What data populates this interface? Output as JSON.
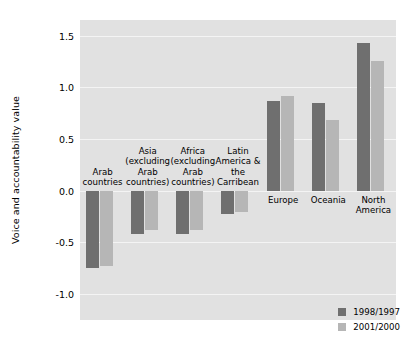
{
  "chart_data": {
    "type": "bar",
    "title": "",
    "xlabel": "",
    "ylabel": "Voice and accountability value",
    "ylim": [
      -1.25,
      1.65
    ],
    "yticks": [
      1.5,
      1.0,
      0.5,
      0.0,
      -0.5,
      -1.0
    ],
    "ytick_labels": [
      "1.5",
      "1.0",
      "0.5",
      "0.0",
      "-0.5",
      "-1.0"
    ],
    "grid": true,
    "legend_position": "bottom-right",
    "categories": [
      "Arab\ncountries",
      "Asia\n(excluding\nArab\ncountries)",
      "Africa\n(excluding\nArab\ncountries)",
      "Latin\nAmerica &\nthe\nCarribean",
      "Europe",
      "Oceania",
      "North\nAmerica"
    ],
    "series": [
      {
        "name": "1998/1997",
        "color": "#6f6f6f",
        "values": [
          -0.75,
          -0.42,
          -0.42,
          -0.23,
          0.87,
          0.85,
          1.43
        ]
      },
      {
        "name": "2001/2000",
        "color": "#b6b6b6",
        "values": [
          -0.73,
          -0.38,
          -0.38,
          -0.21,
          0.92,
          0.68,
          1.25
        ]
      }
    ]
  },
  "legend": {
    "items": [
      {
        "label": "1998/1997",
        "color": "#6f6f6f"
      },
      {
        "label": "2001/2000",
        "color": "#b6b6b6"
      }
    ]
  },
  "colors": {
    "plot_background": "#e1e1e1",
    "gridline": "#f4f4f4",
    "page_background": "#ffffff",
    "text": "#000000"
  }
}
